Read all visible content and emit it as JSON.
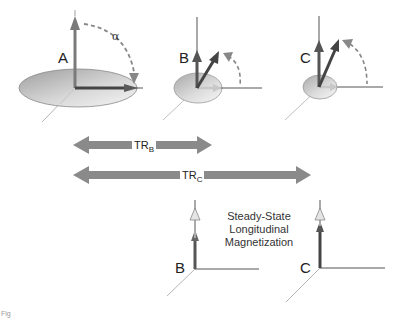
{
  "figure": {
    "type": "MRI flip angle / repetition time diagram",
    "colors": {
      "arrow_dark": "#4a4a4a",
      "arrow_mid": "#707070",
      "arrow_light": "#b0b0b0",
      "axis": "#555555",
      "ellipse_fill_dark": "#a8a8a8",
      "ellipse_fill_light": "#ececec",
      "tr_arrow": "#8a8a8a"
    },
    "panels": [
      {
        "id": "A",
        "label": "A",
        "annotation": "α",
        "annotation_desc": "flip angle arc"
      },
      {
        "id": "B",
        "label": "B"
      },
      {
        "id": "C",
        "label": "C"
      }
    ],
    "tr_arrows": [
      {
        "id": "TR_B",
        "main": "TR",
        "sub": "B"
      },
      {
        "id": "TR_C",
        "main": "TR",
        "sub": "C"
      }
    ],
    "steady_state": {
      "caption_lines": [
        "Steady-State",
        "Longitudinal",
        "Magnetization"
      ],
      "axes": [
        {
          "label": "B"
        },
        {
          "label": "C"
        }
      ]
    },
    "fragment_text": "Fig"
  }
}
